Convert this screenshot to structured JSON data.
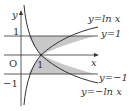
{
  "figure": {
    "type": "function-graph",
    "axes": {
      "x_label": "x",
      "y_label": "y",
      "origin_label": "O"
    },
    "ticks": {
      "y_pos": "1",
      "y_neg": "−1",
      "x_pos": "1"
    },
    "curves": [
      {
        "id": "ln",
        "label": "y=ln x"
      },
      {
        "id": "neg_ln",
        "label": "y=−ln x"
      },
      {
        "id": "h1",
        "label": "y=1"
      },
      {
        "id": "hm1",
        "label": "y=−1"
      }
    ],
    "shaded_region": "area bounded by y=ln x, y=−ln x, y=1 and y=−1",
    "colors": {
      "line": "#333333",
      "shade": "#c8c8c8",
      "background": "#ffffff"
    }
  }
}
